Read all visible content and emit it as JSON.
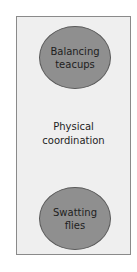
{
  "diagram": {
    "top_node": {
      "label": "Balancing\nteacups",
      "fill": "#8f8f8f"
    },
    "middle_label": "Physical\ncoordination",
    "bottom_node": {
      "label": "Swatting\nflies",
      "fill": "#8f8f8f"
    },
    "panel_fill": "#efefef",
    "panel_border": "#8a8a8a"
  }
}
